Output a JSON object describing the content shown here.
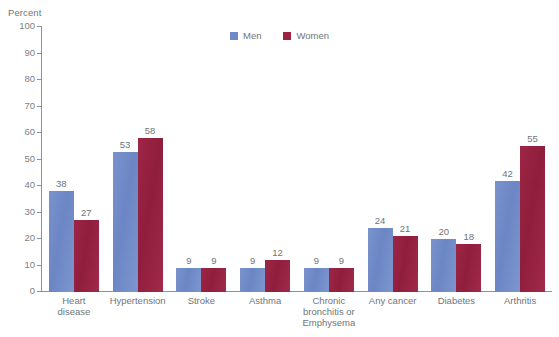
{
  "chart_data": {
    "type": "bar",
    "title": "",
    "xlabel": "",
    "ylabel": "Percent",
    "ylim": [
      0,
      100
    ],
    "ytick_step": 10,
    "yticks": [
      100,
      90,
      80,
      70,
      60,
      50,
      40,
      30,
      20,
      10,
      0
    ],
    "grid": false,
    "legend_position": "top-center",
    "categories": [
      "Heart disease",
      "Hypertension",
      "Stroke",
      "Asthma",
      "Chronic bronchitis or Emphysema",
      "Any cancer",
      "Diabetes",
      "Arthritis"
    ],
    "category_lines": [
      [
        "Heart",
        "disease"
      ],
      [
        "Hypertension"
      ],
      [
        "Stroke"
      ],
      [
        "Asthma"
      ],
      [
        "Chronic",
        "bronchitis or",
        "Emphysema"
      ],
      [
        "Any cancer"
      ],
      [
        "Diabetes"
      ],
      [
        "Arthritis"
      ]
    ],
    "series": [
      {
        "name": "Men",
        "color": "#6f8ac7",
        "values": [
          38,
          53,
          9,
          9,
          9,
          24,
          20,
          42
        ]
      },
      {
        "name": "Women",
        "color": "#9c2343",
        "values": [
          27,
          58,
          9,
          12,
          9,
          21,
          18,
          55
        ]
      }
    ]
  },
  "axis": {
    "y_title": "Percent"
  },
  "legend": {
    "items": [
      {
        "label": "Men"
      },
      {
        "label": "Women"
      }
    ]
  },
  "footnote": {
    "text": ""
  },
  "colors": {
    "men": "#6f8ac7",
    "women": "#9c2343",
    "axis": "#8d9296",
    "text": "#6f7579",
    "background": "#ffffff"
  }
}
